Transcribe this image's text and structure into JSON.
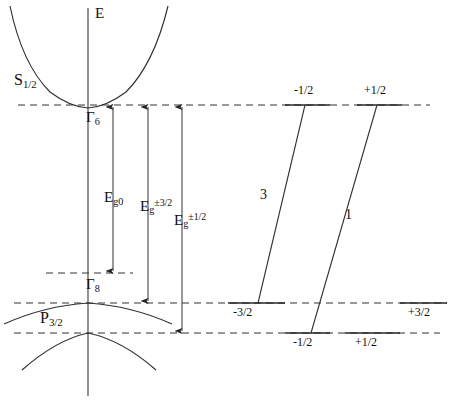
{
  "figure": {
    "kind": "band-structure-and-transition-diagram",
    "background_color": "#ffffff",
    "line_color": "#262626",
    "text_color": "#101010"
  },
  "axis": {
    "energy_axis_label": "E",
    "axis_x": 88,
    "axis_top_y": 8,
    "axis_bottom_y": 396
  },
  "bands": {
    "conduction": {
      "term_symbol_base": "S",
      "term_symbol_sub": "1/2",
      "gamma_label_base": "Γ",
      "gamma_label_sub": "6",
      "edge_y": 105
    },
    "valence": {
      "term_symbol_base": "P",
      "term_symbol_sub": "3/2",
      "gamma_label_base": "Γ",
      "gamma_label_sub": "8",
      "heavy_edge_y": 303,
      "light_edge_y": 333,
      "reference_dash_y": 273
    }
  },
  "energy_gaps": [
    {
      "id": "eg0",
      "base": "E",
      "sub": "g0",
      "sup": "",
      "arrow_x": 113,
      "from_y": 273,
      "to_y": 105,
      "label_x": 104,
      "label_y": 190
    },
    {
      "id": "eg32",
      "base": "E",
      "sub": "g",
      "sup": "±3/2",
      "arrow_x": 148,
      "from_y": 303,
      "to_y": 105,
      "label_x": 140,
      "label_y": 198
    },
    {
      "id": "eg12",
      "base": "E",
      "sub": "g",
      "sup": "±1/2",
      "arrow_x": 182,
      "from_y": 333,
      "to_y": 105,
      "label_x": 174,
      "label_y": 212
    }
  ],
  "level_lines": {
    "upper_dash_y": 105,
    "middle_dash_y": 303,
    "lower_dash_y": 333,
    "short_dash_y": 273
  },
  "transition_panel": {
    "upper_states": [
      {
        "label": "-1/2",
        "tick_x1": 285,
        "tick_x2": 330,
        "y": 105,
        "label_x": 294,
        "label_y": 84
      },
      {
        "label": "+1/2",
        "tick_x1": 357,
        "tick_x2": 402,
        "y": 105,
        "label_x": 364,
        "label_y": 84
      }
    ],
    "middle_states": [
      {
        "label": "-3/2",
        "tick_x1": 228,
        "tick_x2": 285,
        "y": 303,
        "label_x": 233,
        "label_y": 306
      },
      {
        "label": "+3/2",
        "tick_x1": 400,
        "tick_x2": 447,
        "y": 303,
        "label_x": 408,
        "label_y": 306
      }
    ],
    "lower_states": [
      {
        "label": "-1/2",
        "tick_x1": 285,
        "tick_x2": 330,
        "y": 333,
        "label_x": 293,
        "label_y": 336
      },
      {
        "label": "+1/2",
        "tick_x1": 345,
        "tick_x2": 400,
        "y": 333,
        "label_x": 355,
        "label_y": 336
      }
    ],
    "transitions": [
      {
        "strength_label": "3",
        "x1": 305,
        "y1": 105,
        "x2": 258,
        "y2": 303,
        "label_x": 260,
        "label_y": 188
      },
      {
        "strength_label": "1",
        "x1": 377,
        "y1": 105,
        "x2": 311,
        "y2": 333,
        "label_x": 345,
        "label_y": 208
      }
    ]
  }
}
